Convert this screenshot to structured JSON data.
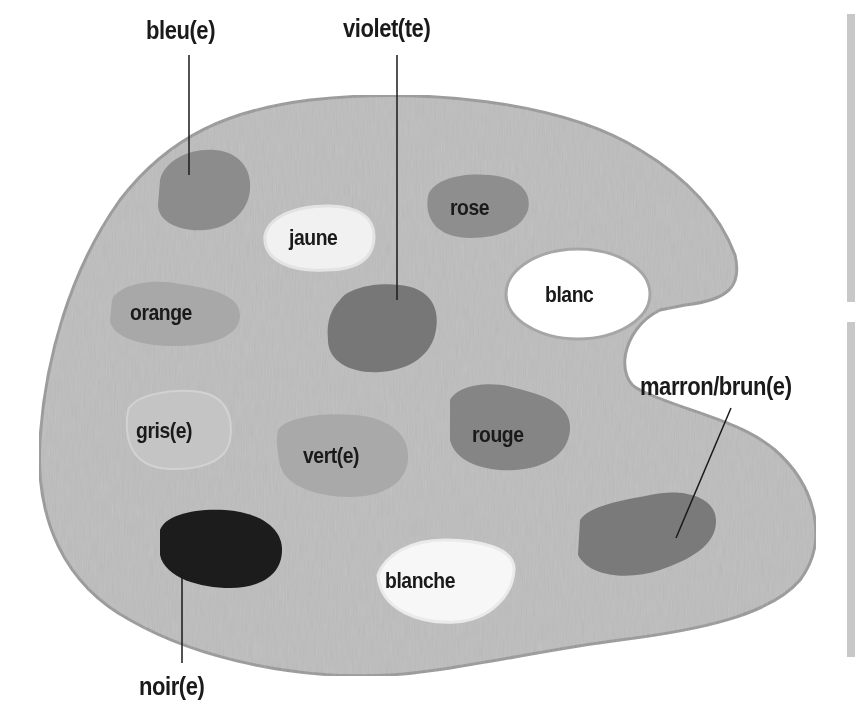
{
  "diagram": {
    "colors": {
      "palette": "#bdbdbd",
      "palette_edge": "#9a9a9a",
      "bleu": "#8c8c8c",
      "violet": "#777777",
      "rose": "#8e8e8e",
      "jaune": "#f1f1f1",
      "blanc": "#ffffff",
      "orange": "#a8a8a8",
      "gris": "#c4c4c4",
      "vert": "#a9a9a9",
      "rouge": "#858585",
      "noir": "#1c1c1c",
      "blanche": "#f7f7f7",
      "marron": "#7a7a7a",
      "side_bar": "#c8c8c8"
    },
    "outer_labels": {
      "bleu": "bleu(e)",
      "violet": "violet(te)",
      "marron": "marron/brun(e)",
      "noir": "noir(e)"
    },
    "inner_labels": {
      "jaune": "jaune",
      "rose": "rose",
      "blanc": "blanc",
      "orange": "orange",
      "gris": "gris(e)",
      "vert": "vert(e)",
      "rouge": "rouge",
      "blanche": "blanche"
    }
  }
}
